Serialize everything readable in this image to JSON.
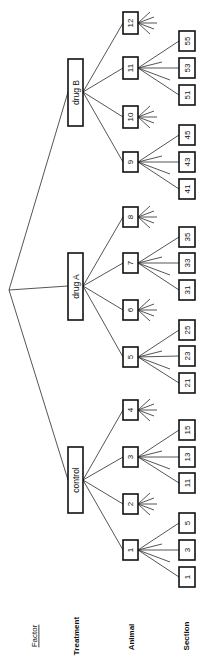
{
  "legend": {
    "title": "Factor",
    "levels": [
      "Treatment",
      "Animal",
      "Section"
    ]
  },
  "tree": {
    "treatments": [
      {
        "label": "control",
        "animals": [
          {
            "label": "1",
            "sections": [
              "1",
              "3",
              "5"
            ]
          },
          {
            "label": "2",
            "sections": []
          },
          {
            "label": "3",
            "sections": [
              "11",
              "13",
              "15"
            ]
          },
          {
            "label": "4",
            "sections": []
          }
        ]
      },
      {
        "label": "drug A",
        "animals": [
          {
            "label": "5",
            "sections": [
              "21",
              "23",
              "25"
            ]
          },
          {
            "label": "6",
            "sections": []
          },
          {
            "label": "7",
            "sections": [
              "31",
              "33",
              "35"
            ]
          },
          {
            "label": "8",
            "sections": []
          }
        ]
      },
      {
        "label": "drug B",
        "animals": [
          {
            "label": "9",
            "sections": [
              "41",
              "43",
              "45"
            ]
          },
          {
            "label": "10",
            "sections": []
          },
          {
            "label": "11",
            "sections": [
              "51",
              "53",
              "55"
            ]
          },
          {
            "label": "12",
            "sections": []
          }
        ]
      }
    ]
  }
}
